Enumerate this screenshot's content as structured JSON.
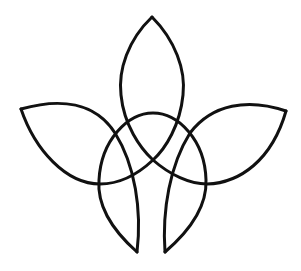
{
  "illustration": {
    "title": "Knotwork floral ornament",
    "stroke_color": "#111111",
    "background_color": "#ffffff",
    "stroke_width": 3,
    "parts": [
      {
        "name": "top-petal",
        "tip": [
          152,
          17
        ]
      },
      {
        "name": "left-petal",
        "tip": [
          21,
          109
        ]
      },
      {
        "name": "right-petal",
        "tip": [
          286,
          111
        ]
      },
      {
        "name": "central-arch",
        "apex": [
          153,
          113
        ]
      },
      {
        "name": "bottom-left-tip",
        "tip": [
          137,
          252
        ]
      },
      {
        "name": "bottom-right-tip",
        "tip": [
          165,
          252
        ]
      }
    ]
  }
}
